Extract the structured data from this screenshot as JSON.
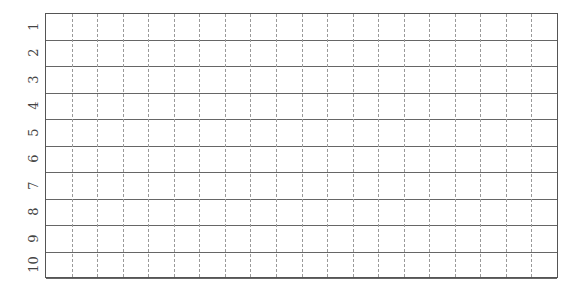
{
  "sheet": {
    "rows": 10,
    "columns": 20,
    "row_labels": [
      "1",
      "2",
      "3",
      "4",
      "5",
      "6",
      "7",
      "8",
      "9",
      "10"
    ]
  }
}
